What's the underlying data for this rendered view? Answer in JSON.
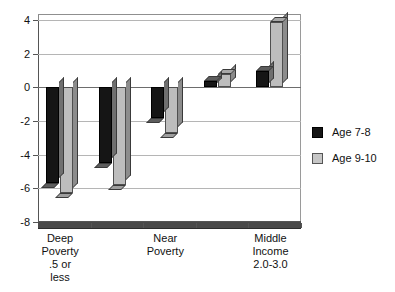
{
  "chart_data": {
    "type": "bar",
    "title": "",
    "subtitle": "",
    "xlabel": "",
    "ylabel": "",
    "ylim": [
      -8,
      4
    ],
    "yticks": [
      4,
      2,
      0,
      -2,
      -4,
      -6,
      -8
    ],
    "ytick_labels": [
      "4",
      "2",
      "0",
      "-2",
      "-4",
      "-6",
      "-8"
    ],
    "grid": true,
    "legend_position": "right",
    "categories": [
      "Deep\nPoverty\n.5 or\nless",
      "",
      "Near\nPoverty",
      "",
      "Middle\nIncome\n2.0-3.0"
    ],
    "category_labels_visible": [
      "Deep\nPoverty\n.5 or\nless",
      "Near\nPoverty",
      "Middle\nIncome\n2.0-3.0"
    ],
    "series": [
      {
        "name": "Age 7-8",
        "color": "#151515",
        "values": [
          -5.7,
          -4.5,
          -1.8,
          0.4,
          1.0
        ]
      },
      {
        "name": "Age 9-10",
        "color": "#bdbdbd",
        "values": [
          -6.3,
          -5.8,
          -2.7,
          0.8,
          3.9
        ]
      }
    ]
  },
  "legend": {
    "items": [
      {
        "label": "Age 7-8",
        "swatch": "dark-square-swatch"
      },
      {
        "label": "Age 9-10",
        "swatch": "light-square-swatch"
      }
    ]
  },
  "axis": {
    "y_tick_labels": [
      "4",
      "2",
      "0",
      "-2",
      "-4",
      "-6",
      "-8"
    ],
    "x_category_labels": [
      "Deep\nPoverty\n.5 or\nless",
      "Near\nPoverty",
      "Middle\nIncome\n2.0-3.0"
    ]
  }
}
